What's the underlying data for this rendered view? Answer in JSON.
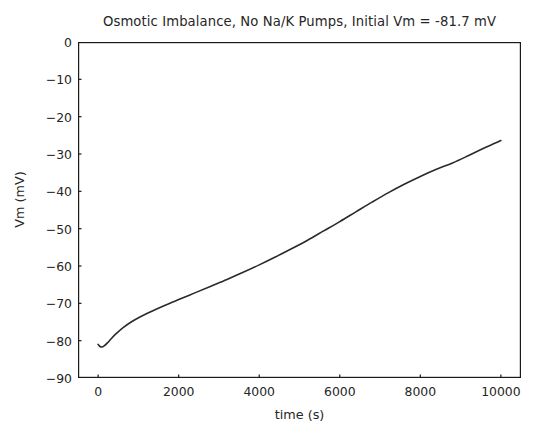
{
  "figure": {
    "background_color": "#ffffff",
    "axes_color": "#1a1a1a",
    "text_color": "#262626"
  },
  "chart_data": {
    "type": "line",
    "title": "Osmotic Imbalance, No Na/K Pumps, Initial Vm = -81.7 mV",
    "xlabel": "time (s)",
    "ylabel": "Vm (mV)",
    "xlim": [
      -500,
      10500
    ],
    "ylim": [
      -90,
      0
    ],
    "xticks": [
      0,
      2000,
      4000,
      6000,
      8000,
      10000
    ],
    "xtick_labels": [
      "0",
      "2000",
      "4000",
      "6000",
      "8000",
      "10000"
    ],
    "yticks": [
      0,
      -10,
      -20,
      -30,
      -40,
      -50,
      -60,
      -70,
      -80,
      -90
    ],
    "ytick_labels": [
      "0",
      "−10",
      "−20",
      "−30",
      "−40",
      "−50",
      "−60",
      "−70",
      "−80",
      "−90"
    ],
    "grid": false,
    "legend": null,
    "line_color": "#2a2a2a",
    "line_width": 1.6,
    "series": [
      {
        "name": "Vm",
        "x": [
          0,
          40,
          90,
          150,
          230,
          330,
          460,
          620,
          820,
          1050,
          1320,
          1650,
          2000,
          2400,
          2800,
          3200,
          3600,
          4000,
          4400,
          4800,
          5200,
          5600,
          6000,
          6400,
          6800,
          7200,
          7600,
          8000,
          8400,
          8800,
          9200,
          9600,
          10000
        ],
        "y": [
          -81.0,
          -81.5,
          -81.7,
          -81.4,
          -80.6,
          -79.4,
          -78.0,
          -76.5,
          -75.0,
          -73.6,
          -72.2,
          -70.6,
          -69.0,
          -67.2,
          -65.4,
          -63.6,
          -61.7,
          -59.7,
          -57.6,
          -55.4,
          -53.1,
          -50.6,
          -48.1,
          -45.5,
          -42.9,
          -40.4,
          -38.1,
          -36.0,
          -34.1,
          -32.4,
          -30.4,
          -28.3,
          -26.4
        ]
      }
    ]
  }
}
